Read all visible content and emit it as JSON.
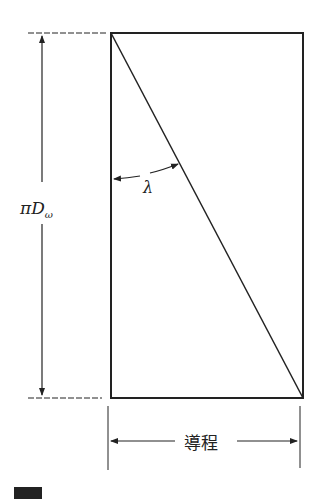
{
  "diagram": {
    "type": "unrolled-helix-lead-angle",
    "labels": {
      "height": "πD",
      "height_subscript": "ω",
      "angle": "λ",
      "lead": "導程"
    },
    "colors": {
      "line": "#222222",
      "background": "#ffffff"
    }
  }
}
